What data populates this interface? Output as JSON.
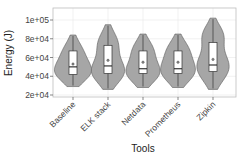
{
  "chart_data": {
    "type": "violin",
    "title": "",
    "xlabel": "Tools",
    "ylabel": "Energy (J)",
    "categories": [
      "Baseline",
      "ELK stack",
      "Netdata",
      "Prometheus",
      "Zipkin"
    ],
    "y_ticks": [
      "2e+04",
      "4e+04",
      "6e+04",
      "8e+04",
      "1e+05"
    ],
    "y_tick_values": [
      20000,
      40000,
      60000,
      80000,
      100000
    ],
    "ylim": [
      18000,
      106000
    ],
    "grid": true,
    "legend": null,
    "series": [
      {
        "name": "Baseline",
        "min": 29000,
        "q1": 42000,
        "median": 50000,
        "mean": 53000,
        "q3": 67000,
        "max": 84000,
        "lower_mode": 44000,
        "upper_mode": 65000
      },
      {
        "name": "ELK stack",
        "min": 26000,
        "q1": 43000,
        "median": 51000,
        "mean": 57000,
        "q3": 73000,
        "max": 95000,
        "lower_mode": 45000,
        "upper_mode": 75000
      },
      {
        "name": "Netdata",
        "min": 28000,
        "q1": 43000,
        "median": 48000,
        "mean": 55000,
        "q3": 67000,
        "max": 85000,
        "lower_mode": 44000,
        "upper_mode": 68000
      },
      {
        "name": "Prometheus",
        "min": 28000,
        "q1": 43000,
        "median": 48000,
        "mean": 55000,
        "q3": 67000,
        "max": 85000,
        "lower_mode": 45000,
        "upper_mode": 68000
      },
      {
        "name": "Zipkin",
        "min": 26000,
        "q1": 45000,
        "median": 52000,
        "mean": 58000,
        "q3": 76000,
        "max": 102000,
        "lower_mode": 50000,
        "upper_mode": 84000
      }
    ],
    "colors": {
      "violin_fill": "#a6a6a6",
      "violin_stroke": "#5a5a5a",
      "box_fill": "#ffffff",
      "box_stroke": "#333333",
      "grid": "#ebebeb",
      "frame": "#bdbdbd"
    }
  }
}
